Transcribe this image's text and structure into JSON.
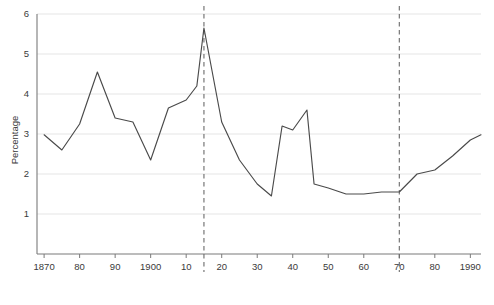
{
  "chart_data": {
    "type": "line",
    "title": "",
    "subtitle": "",
    "xlabel": "",
    "ylabel": "Percentage",
    "xlim": [
      1868,
      1993
    ],
    "ylim": [
      0,
      6
    ],
    "grid": true,
    "legend": false,
    "legend_position": "none",
    "y_ticks": [
      1,
      2,
      3,
      4,
      5,
      6
    ],
    "y_tick_labels": [
      "1",
      "2",
      "3",
      "4",
      "5",
      "6"
    ],
    "x_ticks": [
      1870,
      1880,
      1890,
      1900,
      1910,
      1920,
      1930,
      1940,
      1950,
      1960,
      1970,
      1980,
      1990
    ],
    "x_tick_labels": [
      "1870",
      "80",
      "90",
      "1900",
      "10",
      "20",
      "30",
      "40",
      "50",
      "60",
      "70",
      "80",
      "1990"
    ],
    "series": [
      {
        "name": "Percentage",
        "color": "#4a4a4a",
        "x": [
          1870,
          1875,
          1880,
          1885,
          1890,
          1895,
          1900,
          1905,
          1910,
          1913,
          1915,
          1920,
          1925,
          1930,
          1934,
          1937,
          1940,
          1944,
          1946,
          1950,
          1955,
          1960,
          1965,
          1970,
          1975,
          1980,
          1985,
          1990,
          1993
        ],
        "values": [
          2.98,
          2.6,
          3.25,
          4.55,
          3.4,
          3.3,
          2.35,
          3.65,
          3.85,
          4.2,
          5.65,
          3.3,
          2.35,
          1.75,
          1.45,
          3.2,
          3.1,
          3.6,
          1.75,
          1.65,
          1.5,
          1.5,
          1.55,
          1.55,
          2.0,
          2.1,
          2.45,
          2.85,
          2.98
        ]
      }
    ],
    "annotations": [
      {
        "name": "event-line-1915",
        "type": "vertical-dashed-line",
        "x": 1915,
        "label": ""
      },
      {
        "name": "event-line-1970",
        "type": "vertical-dashed-line",
        "x": 1970,
        "label": ""
      }
    ]
  }
}
